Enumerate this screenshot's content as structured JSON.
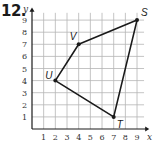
{
  "problem": {
    "number": "12."
  },
  "graph": {
    "x_axis_label": "x",
    "y_axis_label": "y",
    "x_ticks": [
      "1",
      "2",
      "3",
      "4",
      "5",
      "6",
      "7",
      "8",
      "9"
    ],
    "y_ticks": [
      "1",
      "2",
      "3",
      "4",
      "5",
      "6",
      "7",
      "8",
      "9"
    ],
    "grid": true,
    "x_range": [
      0,
      10
    ],
    "y_range": [
      0,
      10
    ]
  },
  "chart_data": {
    "type": "scatter",
    "title": "12.",
    "xlabel": "x",
    "ylabel": "y",
    "xlim": [
      0,
      10
    ],
    "ylim": [
      0,
      10
    ],
    "grid": true,
    "points": [
      {
        "label": "S",
        "x": 9,
        "y": 9
      },
      {
        "label": "V",
        "x": 4,
        "y": 7
      },
      {
        "label": "U",
        "x": 2,
        "y": 4
      },
      {
        "label": "T",
        "x": 7,
        "y": 1
      }
    ],
    "polygon": [
      "S",
      "V",
      "U",
      "T"
    ]
  },
  "colors": {
    "grid": "#b5b5b5",
    "axis": "#1a1a1a",
    "shape": "#1a1a1a"
  }
}
